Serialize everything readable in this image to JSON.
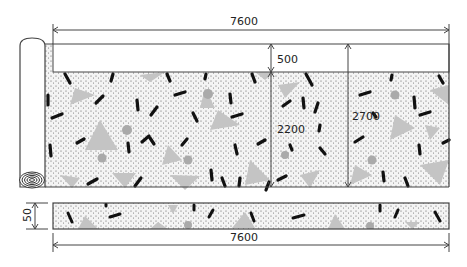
{
  "diagram": {
    "dimensions": {
      "top_width": "7600",
      "top_band_height": "500",
      "pattern_height": "2200",
      "total_height": "2700",
      "strip_height": "50",
      "strip_width": "7600"
    },
    "colors": {
      "line": "#444444",
      "dots": "#555555",
      "triangles": "#c4c4c4",
      "circles": "#aaaaaa",
      "dashes": "#111111",
      "background": "#ffffff"
    }
  }
}
